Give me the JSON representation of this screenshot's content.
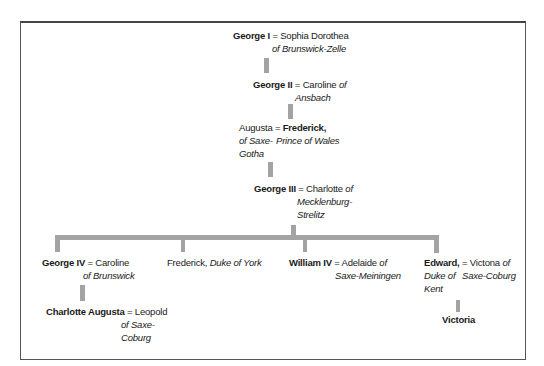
{
  "tree": {
    "george1": {
      "name": "George I",
      "eq": "=",
      "spouse": "Sophia Dorothea",
      "spouse_line2": "of Brunswick-Zelle"
    },
    "george2": {
      "name": "George II",
      "eq": "=",
      "spouse": "Caroline",
      "spouse_of": "of",
      "spouse_line2": "Ansbach"
    },
    "frederick_pow": {
      "spouse": "Augusta",
      "eq": "=",
      "spouse_line2": "of Saxe-",
      "spouse_line3": "Gotha",
      "name": "Frederick,",
      "title": "Prince of Wales"
    },
    "george3": {
      "name": "George III",
      "eq": "=",
      "spouse": "Charlotte",
      "spouse_of": "of",
      "spouse_line2": "Mecklenburg-",
      "spouse_line3": "Strelitz"
    },
    "george4": {
      "name": "George IV",
      "eq": "=",
      "spouse": "Caroline",
      "spouse_line2": "of Brunswick"
    },
    "frederick_york": {
      "name": "Frederick,",
      "title": "Duke of York"
    },
    "william4": {
      "name": "William IV",
      "eq": "=",
      "spouse": "Adelaide",
      "spouse_of": "of",
      "spouse_line2": "Saxe-Meiningen"
    },
    "edward": {
      "name": "Edward,",
      "eq": "=",
      "title_line2": "Duke of",
      "title_line3": "Kent",
      "spouse": "Victona",
      "spouse_of": "of",
      "spouse_line2": "Saxe-Coburg"
    },
    "charlotte_augusta": {
      "name": "Charlotte Augusta",
      "eq": "=",
      "spouse": "Leopold",
      "spouse_line2": "of Saxe-",
      "spouse_line3": "Coburg"
    },
    "victoria": {
      "name": "Victoria"
    }
  },
  "colors": {
    "connector": "#a3a3a3",
    "border": "#555555",
    "text": "#1a1a1a"
  }
}
